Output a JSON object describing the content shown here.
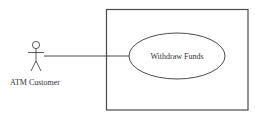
{
  "diagram": {
    "type": "use-case",
    "actor": {
      "name": "ATM Customer",
      "icon": "stick-figure-icon"
    },
    "system_boundary": {
      "label": ""
    },
    "use_cases": [
      {
        "label": "Withdraw Funds"
      }
    ],
    "associations": [
      {
        "from": "ATM Customer",
        "to": "Withdraw Funds"
      }
    ],
    "colors": {
      "stroke": "#4a4a4a",
      "text": "#333333",
      "background": "#ffffff"
    }
  }
}
